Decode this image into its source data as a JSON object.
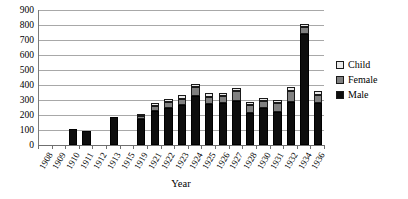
{
  "chart_data": {
    "type": "bar",
    "stacked": true,
    "title": "",
    "xlabel": "Year",
    "ylabel": "",
    "ylim": [
      0,
      900
    ],
    "ytick_step": 100,
    "yticks": [
      0,
      100,
      200,
      300,
      400,
      500,
      600,
      700,
      800,
      900
    ],
    "grid": true,
    "legend_position": "right",
    "categories": [
      "1908",
      "1909",
      "1910",
      "1911",
      "1912",
      "1913",
      "1915",
      "1919",
      "1921",
      "1922",
      "1923",
      "1924",
      "1925",
      "1926",
      "1927",
      "1928",
      "1930",
      "1931",
      "1932",
      "1934",
      "1936"
    ],
    "series": [
      {
        "name": "Male",
        "color": "#0d0d0d",
        "values": [
          0,
          0,
          110,
          95,
          0,
          185,
          0,
          175,
          225,
          250,
          265,
          330,
          275,
          280,
          295,
          215,
          245,
          220,
          290,
          740,
          280
        ]
      },
      {
        "name": "Female",
        "color": "#808080",
        "values": [
          0,
          0,
          0,
          0,
          0,
          0,
          0,
          20,
          35,
          40,
          45,
          55,
          45,
          50,
          65,
          55,
          50,
          60,
          70,
          50,
          55
        ]
      },
      {
        "name": "Child",
        "color": "#eaeaea",
        "values": [
          0,
          0,
          0,
          0,
          0,
          0,
          0,
          15,
          20,
          20,
          25,
          20,
          25,
          20,
          20,
          20,
          20,
          20,
          25,
          20,
          25
        ]
      }
    ],
    "totals": [
      0,
      0,
      110,
      95,
      0,
      185,
      0,
      210,
      280,
      310,
      335,
      405,
      345,
      350,
      380,
      290,
      315,
      300,
      385,
      810,
      360
    ]
  },
  "legend": {
    "items": [
      {
        "label": "Child",
        "swatch": "child"
      },
      {
        "label": "Female",
        "swatch": "female"
      },
      {
        "label": "Male",
        "swatch": "male"
      }
    ]
  }
}
